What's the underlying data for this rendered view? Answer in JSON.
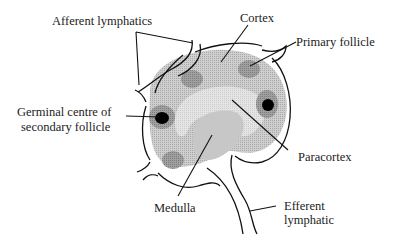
{
  "diagram": {
    "labels": {
      "afferent": "Afferent lymphatics",
      "cortex": "Cortex",
      "primary_follicle": "Primary follicle",
      "germinal_line1": "Germinal centre of",
      "germinal_line2": "secondary follicle",
      "paracortex": "Paracortex",
      "medulla": "Medulla",
      "efferent_line1": "Efferent",
      "efferent_line2": "lymphatic"
    },
    "colors": {
      "cortex_fill": "#c4c4c4",
      "paracortex_fill": "#dcdcdc",
      "medulla_fill": "#c9c9c9",
      "follicle_fill": "#9a9a9a",
      "germinal_centre": "#000000",
      "outline": "#111111"
    }
  }
}
